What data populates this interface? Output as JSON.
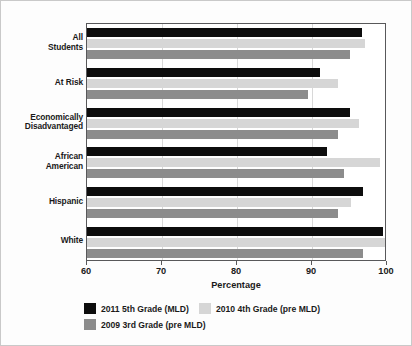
{
  "chart_data": {
    "type": "bar",
    "orientation": "horizontal",
    "title": "",
    "xlabel": "Percentage",
    "ylabel": "",
    "xlim": [
      60,
      100
    ],
    "xticks": [
      60,
      70,
      80,
      90,
      100
    ],
    "grid": true,
    "legend_position": "bottom",
    "categories": [
      "All\nStudents",
      "At Risk",
      "Economically\nDisadvantaged",
      "African\nAmerican",
      "Hispanic",
      "White"
    ],
    "category_labels": [
      [
        "All",
        "Students"
      ],
      [
        "At Risk"
      ],
      [
        "Economically",
        "Disadvantaged"
      ],
      [
        "African",
        "American"
      ],
      [
        "Hispanic"
      ],
      [
        "White"
      ]
    ],
    "series": [
      {
        "name": "2011 5th Grade (MLD)",
        "color": "#0d0d0d",
        "values": [
          96.6,
          91.0,
          95.0,
          92.0,
          96.8,
          99.5
        ]
      },
      {
        "name": "2010 4th Grade (pre MLD)",
        "color": "#d6d6d6",
        "values": [
          97.0,
          93.4,
          96.3,
          99.0,
          95.2,
          99.7
        ]
      },
      {
        "name": "2009 3rd Grade (pre MLD)",
        "color": "#8c8c8c",
        "values": [
          95.0,
          89.4,
          93.4,
          94.3,
          93.4,
          96.8
        ]
      }
    ]
  },
  "axis": {
    "x_title": "Percentage",
    "tick_labels": [
      "60",
      "70",
      "80",
      "90",
      "100"
    ]
  },
  "legend": {
    "items": [
      {
        "label": "2011 5th Grade (MLD)",
        "color": "#0d0d0d"
      },
      {
        "label": "2010 4th Grade (pre MLD)",
        "color": "#d6d6d6"
      },
      {
        "label": "2009 3rd Grade (pre MLD)",
        "color": "#8c8c8c"
      }
    ]
  }
}
